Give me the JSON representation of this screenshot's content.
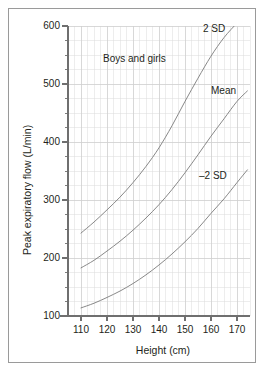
{
  "chart_data": {
    "type": "line",
    "title": "",
    "annotation_main": "Boys and girls",
    "xlabel": "Height (cm)",
    "ylabel": "Peak expiratory flow (L/min)",
    "xlim": [
      105,
      175
    ],
    "ylim": [
      100,
      600
    ],
    "xticks": [
      110,
      120,
      130,
      140,
      150,
      160,
      170
    ],
    "yticks": [
      100,
      200,
      300,
      400,
      500,
      600
    ],
    "xtick_labels": [
      "110",
      "120",
      "130",
      "140",
      "150",
      "160",
      "170"
    ],
    "ytick_labels": [
      "100",
      "200",
      "300",
      "400",
      "500",
      "600"
    ],
    "x_minor_step": 2.5,
    "y_minor_step": 25,
    "grid": true,
    "grid_color": "#dcdcdc",
    "axis_color": "#6f6f6f",
    "line_color": "#7a7a7a",
    "legend_position": "inline-annotations",
    "series": [
      {
        "name": "2 SD",
        "label": "2 SD",
        "x": [
          110,
          115,
          120,
          125,
          130,
          135,
          140,
          145,
          150,
          155,
          160,
          165,
          170,
          172
        ],
        "values": [
          243,
          262,
          283,
          305,
          330,
          358,
          390,
          428,
          470,
          510,
          548,
          580,
          605,
          613
        ]
      },
      {
        "name": "Mean",
        "label": "Mean",
        "x": [
          110,
          115,
          120,
          125,
          130,
          135,
          140,
          145,
          150,
          155,
          160,
          165,
          170,
          174
        ],
        "values": [
          183,
          196,
          212,
          229,
          248,
          269,
          292,
          318,
          347,
          378,
          410,
          440,
          470,
          488
        ]
      },
      {
        "name": "-2 SD",
        "label": "–2 SD",
        "x": [
          110,
          115,
          120,
          125,
          130,
          135,
          140,
          145,
          150,
          155,
          160,
          165,
          170,
          174
        ],
        "values": [
          114,
          122,
          132,
          143,
          156,
          171,
          188,
          207,
          228,
          251,
          277,
          302,
          330,
          352
        ]
      }
    ]
  },
  "axes": {
    "x_title": "Height (cm)",
    "y_title": "Peak expiratory flow (L/min)"
  },
  "annotations": {
    "group": "Boys and girls",
    "upper": "2 SD",
    "middle": "Mean",
    "lower": "–2 SD"
  },
  "ytick_labels": {
    "t600": "600",
    "t500": "500",
    "t400": "400",
    "t300": "300",
    "t200": "200",
    "t100": "100"
  },
  "xtick_labels": {
    "t110": "110",
    "t120": "120",
    "t130": "130",
    "t140": "140",
    "t150": "150",
    "t160": "160",
    "t170": "170"
  }
}
